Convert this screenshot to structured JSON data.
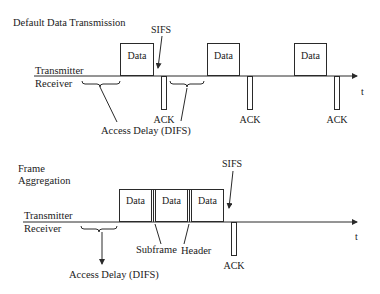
{
  "top": {
    "title": "Default Data Transmission",
    "transmitter_label": "Transmitter",
    "receiver_label": "Receiver",
    "sifs_label": "SIFS",
    "access_delay_label": "Access Delay (DIFS)",
    "time_label": "t",
    "data_label": "Data",
    "ack_label": "ACK",
    "data_frames": [
      {
        "label": "Data"
      },
      {
        "label": "Data"
      },
      {
        "label": "Data"
      }
    ],
    "acks": [
      {
        "label": "ACK"
      },
      {
        "label": "ACK"
      },
      {
        "label": "ACK"
      }
    ]
  },
  "bottom": {
    "title_line1": "Frame",
    "title_line2": "Aggregation",
    "transmitter_label": "Transmitter",
    "receiver_label": "Receiver",
    "sifs_label": "SIFS",
    "access_delay_label": "Access Delay (DIFS)",
    "subframe_label": "Subframe",
    "header_label": "Header",
    "time_label": "t",
    "subframes": [
      {
        "label": "Data"
      },
      {
        "label": "Data"
      },
      {
        "label": "Data"
      }
    ],
    "ack_label": "ACK"
  }
}
